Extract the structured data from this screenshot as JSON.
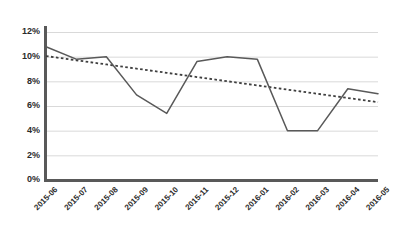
{
  "chart_data": {
    "type": "line",
    "title": "",
    "subtitle": "",
    "xlabel": "",
    "ylabel": "",
    "categories": [
      "2015-06",
      "2015-07",
      "2015-08",
      "2015-09",
      "2015-10",
      "2015-11",
      "2015-12",
      "2016-01",
      "2016-02",
      "2016-03",
      "2016-04",
      "2016-05"
    ],
    "series": [
      {
        "name": "value",
        "style": "solid",
        "color": "#595959",
        "values": [
          10.8,
          9.8,
          10.0,
          6.9,
          5.4,
          9.6,
          10.0,
          9.8,
          4.0,
          4.0,
          7.4,
          7.0
        ]
      },
      {
        "name": "trendline",
        "style": "dotted",
        "color": "#3f3f3f",
        "values": [
          10.05,
          9.71,
          9.37,
          9.03,
          8.69,
          8.35,
          8.01,
          7.67,
          7.33,
          6.99,
          6.65,
          6.31
        ]
      }
    ],
    "ylim": [
      0,
      12
    ],
    "yticks": [
      0,
      2,
      4,
      6,
      8,
      10,
      12
    ],
    "ytick_labels": [
      "0%",
      "2%",
      "4%",
      "6%",
      "8%",
      "10%",
      "12%"
    ],
    "xtick_labels": [
      "2015-06",
      "2015-07",
      "2015-08",
      "2015-09",
      "2015-10",
      "2015-11",
      "2015-12",
      "2016-01",
      "2016-02",
      "2016-03",
      "2016-04",
      "2016-05"
    ],
    "xtick_rotation_deg": 45,
    "grid": {
      "horizontal": true,
      "vertical": false,
      "color": "#d9d9d9"
    },
    "legend": {
      "visible": false,
      "position": "none"
    },
    "axis": {
      "color": "#595959",
      "y_axis_visible": true,
      "x_axis_visible": true
    },
    "background": "#ffffff"
  }
}
